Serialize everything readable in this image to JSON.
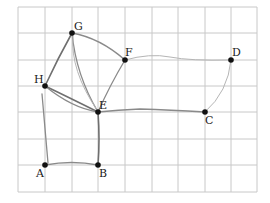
{
  "diagram": {
    "type": "graph-on-grid",
    "grid": {
      "columns": 9,
      "rows": 7,
      "origin_x": 18,
      "origin_y": 7,
      "cell": 26.6,
      "color": "#c8c8c8"
    },
    "nodes": [
      {
        "id": "A",
        "label": "A",
        "gx": 1,
        "gy": 6
      },
      {
        "id": "B",
        "label": "B",
        "gx": 3,
        "gy": 6
      },
      {
        "id": "C",
        "label": "C",
        "gx": 7,
        "gy": 4
      },
      {
        "id": "D",
        "label": "D",
        "gx": 8,
        "gy": 2
      },
      {
        "id": "E",
        "label": "E",
        "gx": 3,
        "gy": 4
      },
      {
        "id": "F",
        "label": "F",
        "gx": 4,
        "gy": 2
      },
      {
        "id": "G",
        "label": "G",
        "gx": 2,
        "gy": 1
      },
      {
        "id": "H",
        "label": "H",
        "gx": 1,
        "gy": 3
      }
    ],
    "edges": [
      [
        "G",
        "F"
      ],
      [
        "F",
        "D"
      ],
      [
        "D",
        "C"
      ],
      [
        "C",
        "E"
      ],
      [
        "E",
        "F"
      ],
      [
        "G",
        "H"
      ],
      [
        "G",
        "E"
      ],
      [
        "H",
        "E"
      ],
      [
        "H",
        "A"
      ],
      [
        "A",
        "B"
      ],
      [
        "B",
        "E"
      ]
    ],
    "node_color": "#111111",
    "edge_color": "#8a8a8a"
  },
  "labels": {
    "A": "A",
    "B": "B",
    "C": "C",
    "D": "D",
    "E": "E",
    "F": "F",
    "G": "G",
    "H": "H"
  }
}
